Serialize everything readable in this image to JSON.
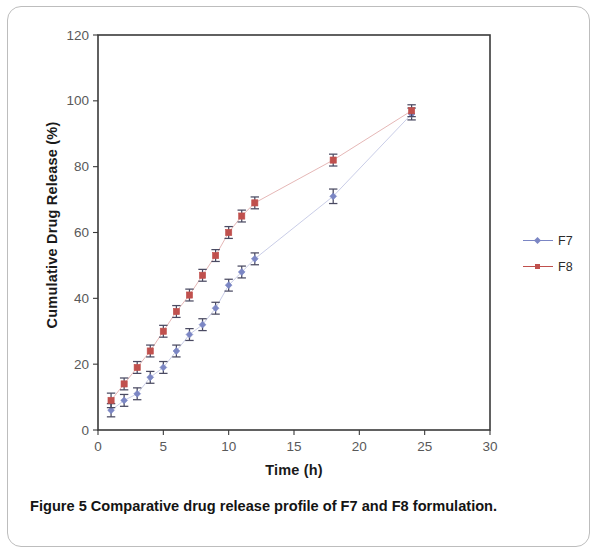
{
  "figure": {
    "caption_label": "Figure 5",
    "caption_text": "Comparative drug release profile of F7 and F8 formulation.",
    "caption_full": "Figure 5 Comparative drug release profile of F7 and F8 formulation."
  },
  "legend": {
    "position": "right",
    "entries": [
      {
        "label": "F7",
        "color": "#7b86c4"
      },
      {
        "label": "F8",
        "color": "#c0504d"
      }
    ]
  },
  "colors": {
    "series_f7": "#7b86c4",
    "series_f8": "#c0504d",
    "axis": "#3a3a3a",
    "tick_label": "#595959",
    "gridline": "#d9d9d9",
    "frame": "#bdbdbd"
  },
  "chart_data": {
    "type": "line",
    "title": "",
    "subtitle": "",
    "xlabel": "Time (h)",
    "ylabel": "Cumulative Drug Release (%)",
    "xlim": [
      0,
      30
    ],
    "ylim": [
      0,
      120
    ],
    "xticks": [
      0,
      5,
      10,
      15,
      20,
      25,
      30
    ],
    "yticks": [
      0,
      20,
      40,
      60,
      80,
      100,
      120
    ],
    "xtick_labels": [
      "0",
      "5",
      "10",
      "15",
      "20",
      "25",
      "30"
    ],
    "ytick_labels": [
      "0",
      "20",
      "40",
      "60",
      "80",
      "100",
      "120"
    ],
    "grid": false,
    "legend_position": "right",
    "error_bars": true,
    "x": [
      1,
      2,
      3,
      4,
      5,
      6,
      7,
      8,
      9,
      10,
      11,
      12,
      18,
      24
    ],
    "series": [
      {
        "name": "F7",
        "color": "#7b86c4",
        "marker": "diamond",
        "values": [
          6,
          9,
          11,
          16,
          19,
          24,
          29,
          32,
          37,
          44,
          48,
          52,
          71,
          96
        ],
        "errors": [
          2.0,
          1.8,
          1.8,
          1.8,
          1.8,
          1.8,
          1.8,
          1.8,
          1.8,
          1.8,
          1.8,
          1.8,
          2.2,
          1.8
        ]
      },
      {
        "name": "F8",
        "color": "#c0504d",
        "marker": "square",
        "values": [
          9,
          14,
          19,
          24,
          30,
          36,
          41,
          47,
          53,
          60,
          65,
          69,
          82,
          97
        ],
        "errors": [
          2.2,
          1.8,
          1.8,
          1.8,
          1.8,
          1.8,
          1.8,
          1.8,
          1.8,
          1.8,
          1.8,
          1.8,
          1.8,
          1.8
        ]
      }
    ]
  }
}
